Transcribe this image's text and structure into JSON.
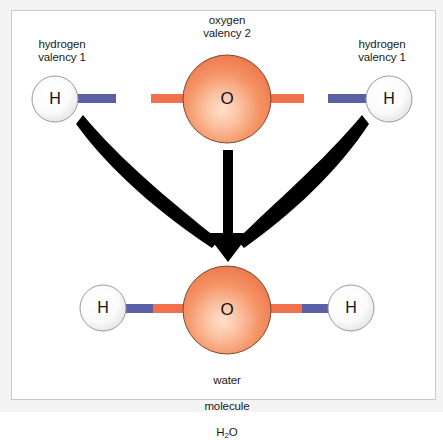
{
  "figure": {
    "name": "water-molecule-formation-diagram",
    "background_color": "#ffffff",
    "outer_background_color": "#f4f4f4",
    "frame_border_color": "#c9c9c9"
  },
  "colors": {
    "oxygen_fill_light": "#fbc9ad",
    "oxygen_fill_mid": "#f59264",
    "oxygen_fill_edge": "#ef7f55",
    "oxygen_stroke": "#7a4a33",
    "hydrogen_fill_light": "#ffffff",
    "hydrogen_fill_edge": "#e3e3e3",
    "hydrogen_stroke": "#9a9a9a",
    "bond_blue": "#5b5fa5",
    "bond_orange": "#f0714a",
    "arrow_black": "#000000",
    "text": "#1a1a1a"
  },
  "labels": {
    "hydrogen_left": "hydrogen\nvalency 1",
    "oxygen": "oxygen\nvalency 2",
    "hydrogen_right": "hydrogen\nvalency 1",
    "water_line1": "water",
    "water_line2": "molecule",
    "water_formula_main": "H",
    "water_formula_sub": "2",
    "water_formula_tail": "O"
  },
  "atoms": {
    "reactant_hydrogen_left": {
      "symbol": "H",
      "cx": 55,
      "cy": 99,
      "r": 23
    },
    "reactant_oxygen": {
      "symbol": "O",
      "cx": 227,
      "cy": 99,
      "r": 44
    },
    "reactant_hydrogen_right": {
      "symbol": "H",
      "cx": 389,
      "cy": 99,
      "r": 23
    },
    "product_hydrogen_left": {
      "symbol": "H",
      "cx": 103,
      "cy": 308,
      "r": 23
    },
    "product_oxygen": {
      "symbol": "O",
      "cx": 227,
      "cy": 310,
      "r": 44
    },
    "product_hydrogen_right": {
      "symbol": "H",
      "cx": 351,
      "cy": 308,
      "r": 23
    }
  },
  "bonds": {
    "reactant_h_left": {
      "color": "bond_blue",
      "x": 76,
      "y": 94,
      "w": 40,
      "h": 9
    },
    "reactant_o_left": {
      "color": "bond_orange",
      "x": 151,
      "y": 94,
      "w": 40,
      "h": 9
    },
    "reactant_o_right": {
      "color": "bond_orange",
      "x": 264,
      "y": 94,
      "w": 40,
      "h": 9
    },
    "reactant_h_right": {
      "color": "bond_blue",
      "x": 328,
      "y": 94,
      "w": 40,
      "h": 9
    },
    "product_left_blue": {
      "color": "bond_blue",
      "x": 123,
      "y": 304,
      "w": 29,
      "h": 9
    },
    "product_left_orange": {
      "color": "bond_orange",
      "x": 152,
      "y": 304,
      "w": 37,
      "h": 9
    },
    "product_right_orange": {
      "color": "bond_orange",
      "x": 266,
      "y": 304,
      "w": 37,
      "h": 9
    },
    "product_right_blue": {
      "color": "bond_blue",
      "x": 303,
      "y": 304,
      "w": 29,
      "h": 9
    }
  },
  "arrows": {
    "count": 3,
    "converge_point": {
      "x": 228,
      "y": 252
    },
    "left": {
      "from": {
        "x": 85,
        "y": 118
      },
      "description": "curved arrow from left hydrogen to water molecule"
    },
    "center": {
      "from": {
        "x": 228,
        "y": 150
      },
      "description": "straight arrow from oxygen down to water molecule"
    },
    "right": {
      "from": {
        "x": 371,
        "y": 118
      },
      "description": "curved arrow from right hydrogen to water molecule"
    }
  }
}
